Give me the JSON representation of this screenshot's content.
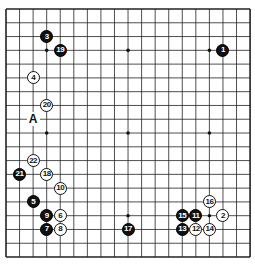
{
  "board": {
    "size": 19,
    "origin_x": 6,
    "origin_y": 9,
    "spacing_x": 13.56,
    "spacing_y": 13.78,
    "line_color": "#222222",
    "star_points": [
      [
        3,
        3
      ],
      [
        9,
        3
      ],
      [
        15,
        3
      ],
      [
        3,
        9
      ],
      [
        9,
        9
      ],
      [
        15,
        9
      ],
      [
        3,
        15
      ],
      [
        9,
        15
      ],
      [
        15,
        15
      ]
    ]
  },
  "stones": [
    {
      "n": "1",
      "color": "black",
      "col": 16,
      "row": 3
    },
    {
      "n": "2",
      "color": "white",
      "col": 16,
      "row": 15
    },
    {
      "n": "3",
      "color": "black",
      "col": 3,
      "row": 2
    },
    {
      "n": "4",
      "color": "white",
      "col": 2,
      "row": 5
    },
    {
      "n": "5",
      "color": "black",
      "col": 2,
      "row": 14
    },
    {
      "n": "6",
      "color": "white",
      "col": 4,
      "row": 15
    },
    {
      "n": "7",
      "color": "black",
      "col": 3,
      "row": 16
    },
    {
      "n": "8",
      "color": "white",
      "col": 4,
      "row": 16
    },
    {
      "n": "9",
      "color": "black",
      "col": 3,
      "row": 15
    },
    {
      "n": "10",
      "color": "white",
      "col": 4,
      "row": 13
    },
    {
      "n": "11",
      "color": "black",
      "col": 14,
      "row": 15
    },
    {
      "n": "12",
      "color": "white",
      "col": 14,
      "row": 16
    },
    {
      "n": "13",
      "color": "black",
      "col": 13,
      "row": 16
    },
    {
      "n": "14",
      "color": "white",
      "col": 15,
      "row": 16
    },
    {
      "n": "15",
      "color": "black",
      "col": 13,
      "row": 15
    },
    {
      "n": "16",
      "color": "white",
      "col": 15,
      "row": 14
    },
    {
      "n": "17",
      "color": "black",
      "col": 9,
      "row": 16
    },
    {
      "n": "18",
      "color": "white",
      "col": 3,
      "row": 12
    },
    {
      "n": "19",
      "color": "black",
      "col": 4,
      "row": 3
    },
    {
      "n": "20",
      "color": "white",
      "col": 3,
      "row": 7
    },
    {
      "n": "21",
      "color": "black",
      "col": 1,
      "row": 12
    },
    {
      "n": "22",
      "color": "white",
      "col": 2,
      "row": 11
    }
  ],
  "labels": [
    {
      "text": "A",
      "col": 2,
      "row": 8
    }
  ]
}
